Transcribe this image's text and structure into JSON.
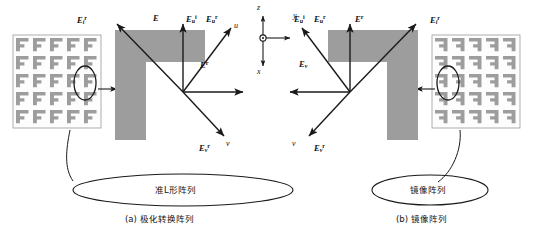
{
  "figure": {
    "title_a": "(a) 极化转换阵列",
    "title_b": "(b) 镜像阵列",
    "ellipse_a_label": "准L形阵列",
    "ellipse_b_label": "镜像阵列"
  },
  "global_axes": {
    "z": "z",
    "y": "y",
    "x": "x",
    "origin_icon": "axis-origin-dot"
  },
  "panel_a": {
    "name": "polarization-conversion-array",
    "array": {
      "rows": 5,
      "cols": 5,
      "element_shape": "L-shaped-patch"
    },
    "fields": {
      "E_i": "E",
      "E_i_sup": "i",
      "E_top_left": "E",
      "E_top_left_sub": "i",
      "E_top_left_sup": "r",
      "E_u_r": "E",
      "E_u_r_sub": "u",
      "E_u_r_sup": "i",
      "E_u_r2": "E",
      "E_u_r2_sub": "u",
      "E_u_r2_sup": "r",
      "E_right": "E",
      "E_right_sup": "r",
      "E_v": "E",
      "E_v_sub": "v",
      "E_v_sup": "r"
    },
    "local_axes": {
      "u": "u",
      "v": "v"
    }
  },
  "panel_b": {
    "name": "mirror-array",
    "array": {
      "rows": 5,
      "cols": 5,
      "element_shape": "L-shaped-patch-mirrored"
    },
    "fields": {
      "E_u": "E",
      "E_u_sub": "u",
      "E_u_sup": "i",
      "E_u2": "E",
      "E_u2_sub": "u",
      "E_u2_sup": "r",
      "E_top": "E",
      "E_top_sup": "r",
      "E_top_right": "E",
      "E_top_right_sub": "i",
      "E_top_right_sup": "r",
      "E_left": "E",
      "E_left_sub": "v",
      "E_v": "E",
      "E_v_sub": "v",
      "E_v_sup": "r"
    },
    "local_axes": {
      "v": "v"
    }
  },
  "colors": {
    "patch_fill": "#9d9d9d",
    "panel_border": "#9a9a9a",
    "stroke": "#1a1a1a",
    "background": "#ffffff"
  }
}
